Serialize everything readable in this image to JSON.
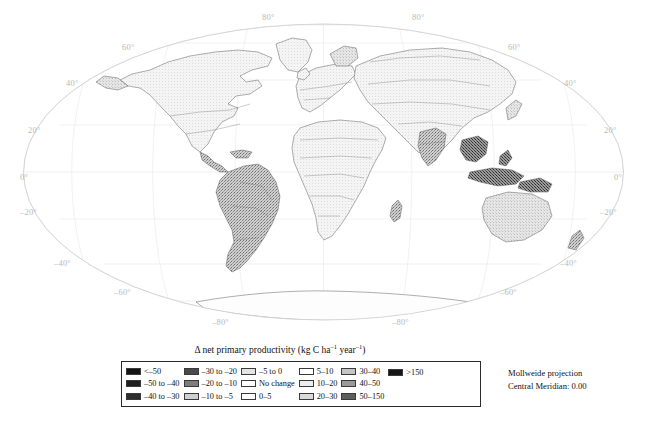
{
  "figure": {
    "type": "thematic-world-map",
    "background": "#ffffff"
  },
  "map": {
    "projection_note_lines": [
      "Mollweide projection",
      "Central Meridian: 0.00"
    ],
    "graticule_label_color": "#b9b9b9",
    "graticule_labels": [
      {
        "text": "80°",
        "x": 268,
        "y": 17
      },
      {
        "text": "80°",
        "x": 418,
        "y": 17
      },
      {
        "text": "60°",
        "x": 128,
        "y": 47
      },
      {
        "text": "60°",
        "x": 512,
        "y": 47
      },
      {
        "text": "40°",
        "x": 72,
        "y": 82
      },
      {
        "text": "40°",
        "x": 568,
        "y": 82
      },
      {
        "text": "20°",
        "x": 32,
        "y": 129
      },
      {
        "text": "20°",
        "x": 608,
        "y": 129
      },
      {
        "text": "0°",
        "x": 22,
        "y": 176
      },
      {
        "text": "0°",
        "x": 616,
        "y": 176
      },
      {
        "text": "–20°",
        "x": 26,
        "y": 211
      },
      {
        "text": "–20°",
        "x": 605,
        "y": 211
      },
      {
        "text": "–40°",
        "x": 60,
        "y": 262
      },
      {
        "text": "–40°",
        "x": 565,
        "y": 262
      },
      {
        "text": "–60°",
        "x": 120,
        "y": 290
      },
      {
        "text": "–60°",
        "x": 505,
        "y": 290
      },
      {
        "text": "–80°",
        "x": 218,
        "y": 320
      },
      {
        "text": "–80°",
        "x": 398,
        "y": 320
      }
    ]
  },
  "legend": {
    "title": "Δ net primary productivity (kg C ha",
    "title_sup_1": "–1",
    "title_mid": " year",
    "title_sup_2": "–1",
    "title_end": ")",
    "columns": [
      {
        "entries": [
          {
            "label": "<–50",
            "color": "#141414"
          },
          {
            "label": "–50 to –40",
            "color": "#1e1e1e"
          },
          {
            "label": "–40 to –30",
            "color": "#2e2e2e"
          }
        ]
      },
      {
        "entries": [
          {
            "label": "–30 to –20",
            "color": "#4a4a4a"
          },
          {
            "label": "–20 to –10",
            "color": "#7d7d7d"
          },
          {
            "label": "–10 to –5",
            "color": "#cfcfcf"
          }
        ]
      },
      {
        "entries": [
          {
            "label": "–5 to 0",
            "color": "#e3e3e3"
          },
          {
            "label": "No change",
            "color": "#ffffff"
          },
          {
            "label": "0–5",
            "color": "#ffffff"
          }
        ]
      },
      {
        "entries": [
          {
            "label": "5–10",
            "color": "#ffffff"
          },
          {
            "label": "10–20",
            "color": "#ededed"
          },
          {
            "label": "20–30",
            "color": "#dadada"
          }
        ]
      },
      {
        "entries": [
          {
            "label": "30–40",
            "color": "#c4c4c4"
          },
          {
            "label": "40–50",
            "color": "#9a9a9a"
          },
          {
            "label": "50–150",
            "color": "#5e5e5e"
          }
        ]
      },
      {
        "entries": [
          {
            "label": ">150",
            "color": "#151515"
          }
        ]
      }
    ]
  }
}
